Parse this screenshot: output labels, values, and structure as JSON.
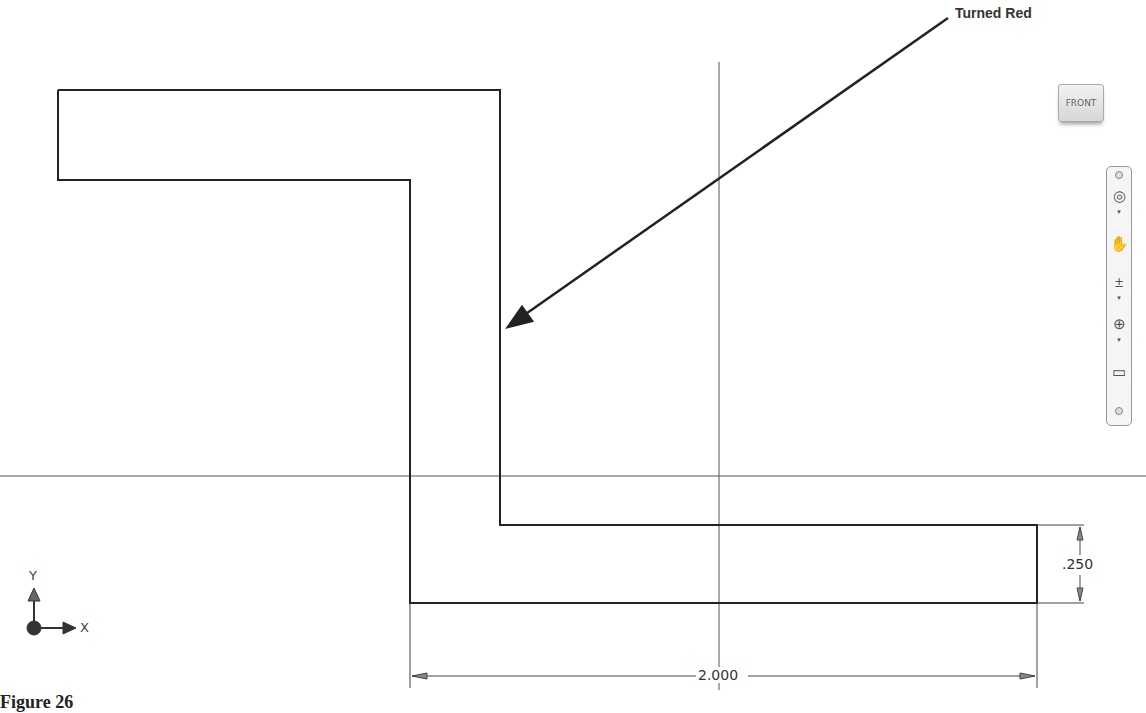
{
  "callout": {
    "text": "Turned Red"
  },
  "viewcube": {
    "face": "FRONT"
  },
  "navbar": {
    "items": [
      {
        "name": "steering-wheel",
        "glyph": "◎"
      },
      {
        "name": "pan",
        "glyph": "✋"
      },
      {
        "name": "zoom",
        "glyph": "±"
      },
      {
        "name": "orbit",
        "glyph": "⊕"
      },
      {
        "name": "look-at",
        "glyph": "▭"
      }
    ]
  },
  "dimensions": {
    "horizontal": "2.000",
    "vertical": ".250"
  },
  "triad": {
    "x_label": "X",
    "y_label": "Y"
  },
  "caption": {
    "text": "Figure 26"
  }
}
